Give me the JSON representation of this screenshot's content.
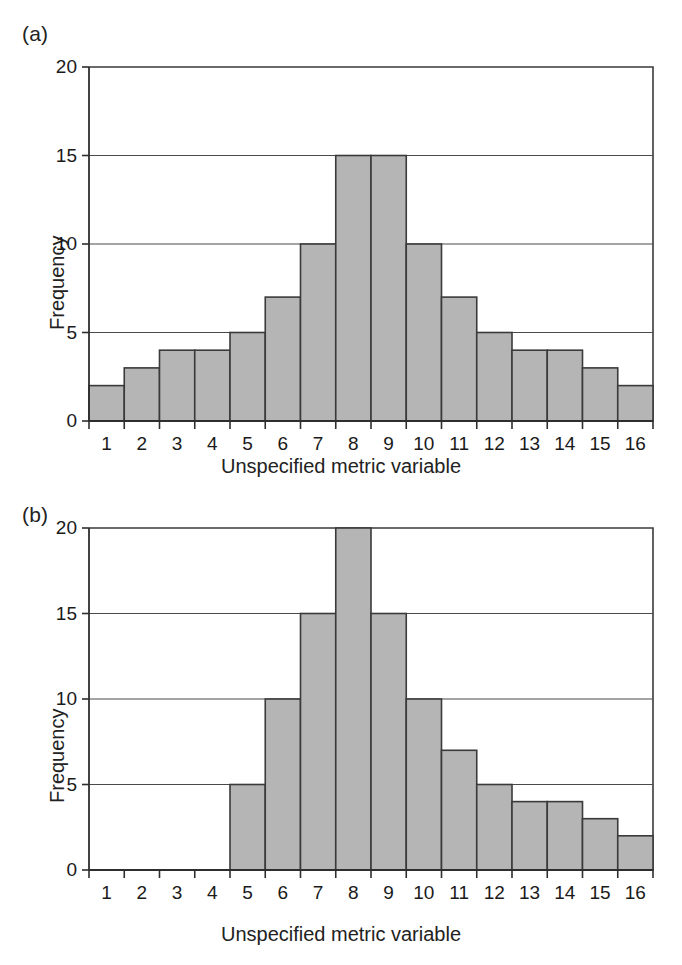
{
  "figure": {
    "background": "#ffffff",
    "bar_fill": "#b5b5b5",
    "bar_stroke": "#3a3a3a",
    "grid_color": "#4a4a4a"
  },
  "panels": [
    {
      "tag": "(a)",
      "xlabel": "Unspecified metric variable",
      "ylabel": "Frequency"
    },
    {
      "tag": "(b)",
      "xlabel": "Unspecified metric variable",
      "ylabel": "Frequency"
    }
  ],
  "chart_data": [
    {
      "type": "bar",
      "title": "(a)",
      "xlabel": "Unspecified metric variable",
      "ylabel": "Frequency",
      "categories": [
        "1",
        "2",
        "3",
        "4",
        "5",
        "6",
        "7",
        "8",
        "9",
        "10",
        "11",
        "12",
        "13",
        "14",
        "15",
        "16"
      ],
      "values": [
        2,
        3,
        4,
        4,
        5,
        7,
        10,
        15,
        15,
        10,
        7,
        5,
        4,
        4,
        3,
        2
      ],
      "ylim": [
        0,
        20
      ],
      "yticks": [
        0,
        5,
        10,
        15,
        20
      ],
      "ytick_labels": [
        "0",
        "5",
        "10",
        "15",
        "20"
      ],
      "xticks": [
        "1",
        "2",
        "3",
        "4",
        "5",
        "6",
        "7",
        "8",
        "9",
        "10",
        "11",
        "12",
        "13",
        "14",
        "15",
        "16"
      ],
      "grid": "horizontal",
      "legend": "none",
      "note": "symmetric unimodal histogram, bars span all 16 bins"
    },
    {
      "type": "bar",
      "title": "(b)",
      "xlabel": "Unspecified metric variable",
      "ylabel": "Frequency",
      "categories": [
        "1",
        "2",
        "3",
        "4",
        "5",
        "6",
        "7",
        "8",
        "9",
        "10",
        "11",
        "12",
        "13",
        "14",
        "15",
        "16"
      ],
      "values": [
        0,
        0,
        0,
        0,
        5,
        10,
        15,
        20,
        15,
        10,
        7,
        5,
        4,
        4,
        3,
        2
      ],
      "ylim": [
        0,
        20
      ],
      "yticks": [
        0,
        5,
        10,
        15,
        20
      ],
      "ytick_labels": [
        "0",
        "5",
        "10",
        "15",
        "20"
      ],
      "xticks": [
        "1",
        "2",
        "3",
        "4",
        "5",
        "6",
        "7",
        "8",
        "9",
        "10",
        "11",
        "12",
        "13",
        "14",
        "15",
        "16"
      ],
      "grid": "horizontal",
      "legend": "none",
      "note": "right-skewed histogram; bins 1-4 empty, peak of 20 at bin 8"
    }
  ]
}
